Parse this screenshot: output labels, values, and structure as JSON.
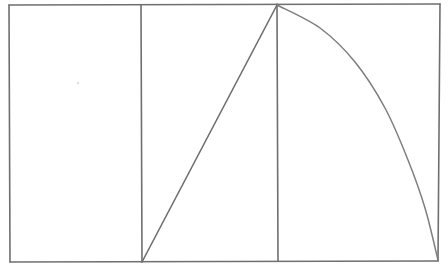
{
  "figure": {
    "title": "Geometric construction: rectangle divided by two vertical lines with inscribed triangle and quarter arc",
    "background_color": "#ffffff",
    "stroke_color": "#6f6f6f",
    "canvas": {
      "width": 448,
      "height": 267
    },
    "outer_rectangle": {
      "name": "outer-rectangle",
      "top_left": {
        "x": 9,
        "y": 5
      },
      "top_right": {
        "x": 440,
        "y": 4
      },
      "bottom_right": {
        "x": 438,
        "y": 261
      },
      "bottom_left": {
        "x": 10,
        "y": 262
      }
    },
    "vertical_divider_1": {
      "name": "vertical-divider-left",
      "top": {
        "x": 141,
        "y": 5
      },
      "bottom": {
        "x": 142,
        "y": 262
      }
    },
    "vertical_divider_2": {
      "name": "vertical-divider-right",
      "top": {
        "x": 277,
        "y": 4
      },
      "bottom": {
        "x": 278,
        "y": 261
      }
    },
    "diagonal": {
      "name": "diagonal-hypotenuse",
      "start": {
        "x": 142,
        "y": 262
      },
      "end": {
        "x": 277,
        "y": 5
      }
    },
    "arc": {
      "name": "quarter-arc",
      "start": {
        "x": 277,
        "y": 5
      },
      "end": {
        "x": 438,
        "y": 260
      },
      "control": {
        "x": 400,
        "y": 58
      },
      "sampled_points": [
        {
          "x": 277,
          "y": 5
        },
        {
          "x": 320,
          "y": 28
        },
        {
          "x": 355,
          "y": 62
        },
        {
          "x": 385,
          "y": 108
        },
        {
          "x": 408,
          "y": 160
        },
        {
          "x": 425,
          "y": 208
        },
        {
          "x": 438,
          "y": 260
        }
      ]
    },
    "speck": {
      "name": "scan-speck",
      "x": 78,
      "y": 83,
      "radius": 1.2
    }
  }
}
